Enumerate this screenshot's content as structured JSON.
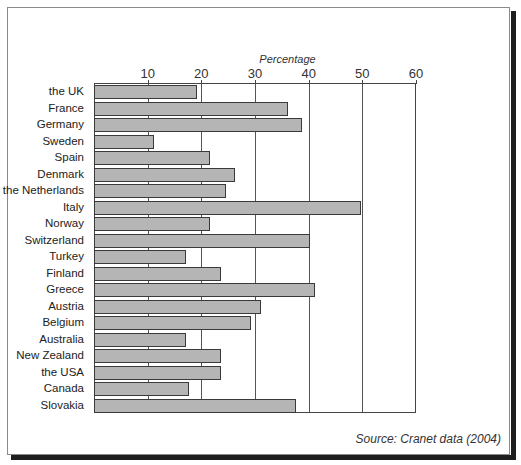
{
  "chart_data": {
    "type": "bar",
    "orientation": "horizontal",
    "title": "",
    "xlabel": "Percentage",
    "ylabel": "",
    "xlim": [
      0,
      60
    ],
    "xticks": [
      10,
      20,
      30,
      40,
      50,
      60
    ],
    "grid": true,
    "legend": null,
    "categories": [
      "the UK",
      "France",
      "Germany",
      "Sweden",
      "Spain",
      "Denmark",
      "the Netherlands",
      "Italy",
      "Norway",
      "Switzerland",
      "Turkey",
      "Finland",
      "Greece",
      "Austria",
      "Belgium",
      "Australia",
      "New Zealand",
      "the USA",
      "Canada",
      "Slovakia"
    ],
    "values": [
      19,
      36,
      38.5,
      11,
      21.5,
      26,
      24.5,
      49.5,
      21.5,
      40,
      17,
      23.5,
      41,
      31,
      29,
      17,
      23.5,
      23.5,
      17.5,
      37.5
    ],
    "source": "Source: Cranet data (2004)"
  },
  "colors": {
    "bar_fill": "#b5b5b5",
    "bar_border": "#3a3a3a",
    "frame_shadow": "#1e1e1e"
  },
  "labels": {
    "axis_title": "Percentage",
    "source": "Source: Cranet data (2004)",
    "ticks": [
      "10",
      "20",
      "30",
      "40",
      "50",
      "60"
    ]
  }
}
